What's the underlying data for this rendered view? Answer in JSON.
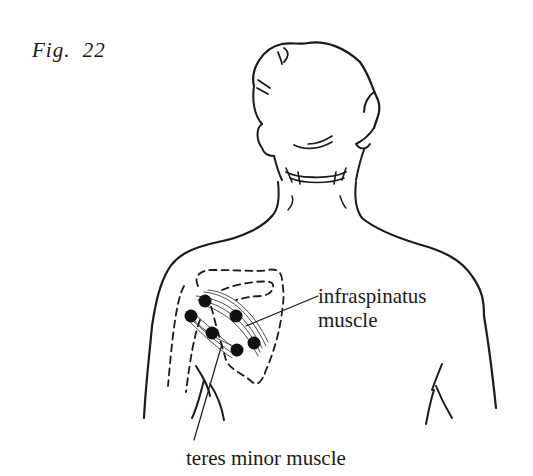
{
  "figure": {
    "number_label": "Fig.  22"
  },
  "labels": {
    "infraspinatus_line1": "infraspinatus",
    "infraspinatus_line2": "muscle",
    "teres_minor": "teres minor muscle"
  },
  "colors": {
    "ink": "#1a1a1a",
    "background": "#ffffff"
  },
  "trigger_points": [
    {
      "x": 205,
      "y": 301
    },
    {
      "x": 236,
      "y": 316
    },
    {
      "x": 191,
      "y": 316
    },
    {
      "x": 212,
      "y": 333
    },
    {
      "x": 254,
      "y": 343
    },
    {
      "x": 237,
      "y": 350
    }
  ]
}
